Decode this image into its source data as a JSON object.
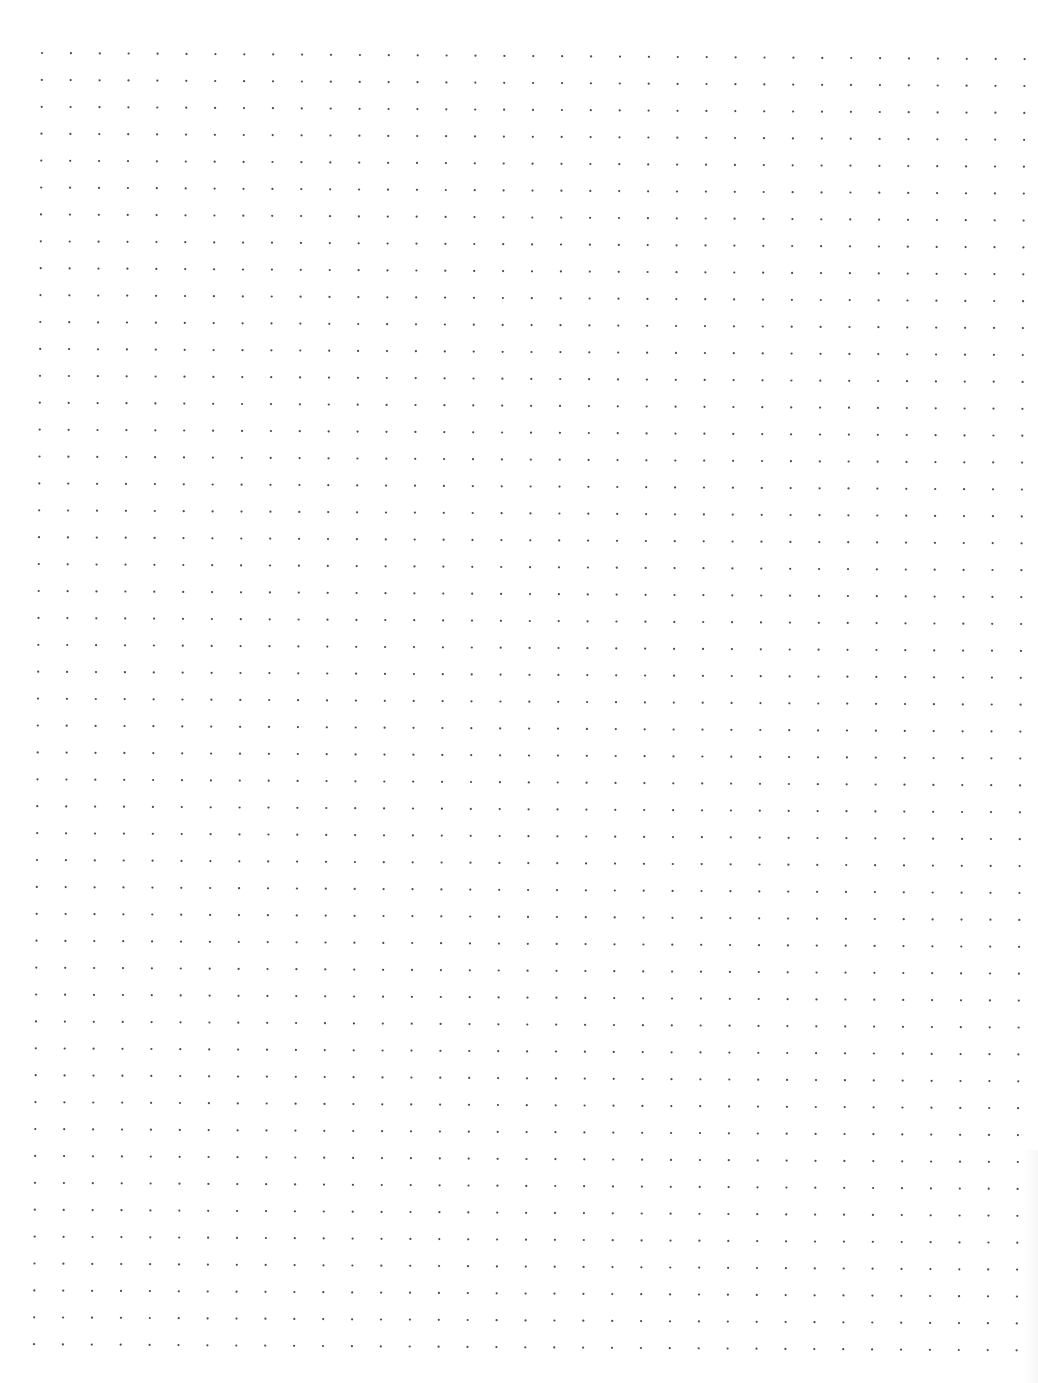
{
  "page": {
    "type": "dot-grid-paper",
    "background_color": "#ffffff",
    "width": 1038,
    "height": 1383
  },
  "dot_grid": {
    "columns": 35,
    "rows": 49,
    "origin_top_left": [
      42,
      53
    ],
    "origin_bottom_left": [
      34,
      1343
    ],
    "pitch_x": 28.9,
    "pitch_y": 26.9,
    "dot_radius": 1.1,
    "dot_color": "#4a4a4a"
  }
}
